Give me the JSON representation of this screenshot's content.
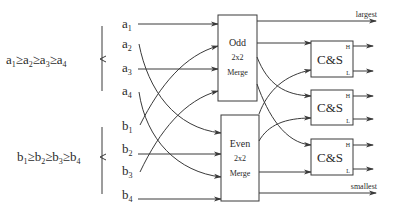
{
  "diagram": {
    "sequences": {
      "a": {
        "ordering": [
          "a",
          "1",
          "≥",
          "a",
          "2",
          "≥",
          "a",
          "3",
          "≥",
          "a",
          "4"
        ],
        "text": "a1≥a2≥a3≥a4"
      },
      "b": {
        "ordering": [
          "b",
          "1",
          "≥",
          "b",
          "2",
          "≥",
          "b",
          "3",
          "≥",
          "b",
          "4"
        ],
        "text": "b1≥b2≥b3≥b4"
      }
    },
    "inputs": [
      {
        "base": "a",
        "sub": "1",
        "target": "odd"
      },
      {
        "base": "a",
        "sub": "2",
        "target": "even"
      },
      {
        "base": "a",
        "sub": "3",
        "target": "odd"
      },
      {
        "base": "a",
        "sub": "4",
        "target": "even"
      },
      {
        "base": "b",
        "sub": "1",
        "target": "odd"
      },
      {
        "base": "b",
        "sub": "2",
        "target": "even"
      },
      {
        "base": "b",
        "sub": "3",
        "target": "odd"
      },
      {
        "base": "b",
        "sub": "4",
        "target": "even"
      }
    ],
    "merge_boxes": {
      "odd": {
        "line1": "Odd",
        "line2": "2x2",
        "line3": "Merge"
      },
      "even": {
        "line1": "Even",
        "line2": "2x2",
        "line3": "Merge"
      }
    },
    "cs_boxes": [
      {
        "label": "C&S",
        "high": "H",
        "low": "L"
      },
      {
        "label": "C&S",
        "high": "H",
        "low": "L"
      },
      {
        "label": "C&S",
        "high": "H",
        "low": "L"
      }
    ],
    "outputs": {
      "largest": "largest",
      "smallest": "smallest"
    },
    "colors": {
      "line": "#3a3a3a",
      "text": "#2a2a2a",
      "background": "#ffffff"
    }
  }
}
